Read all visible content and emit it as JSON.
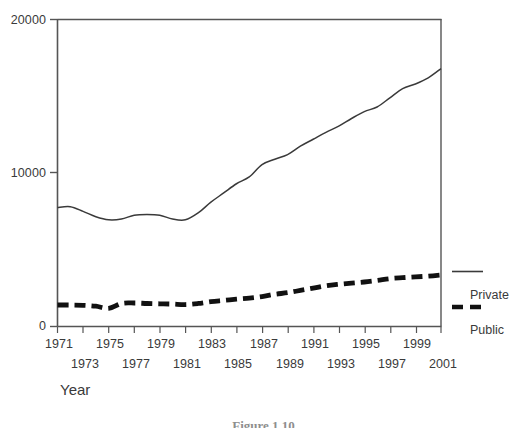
{
  "figure": {
    "caption": "Figure 1.10",
    "x_axis_title": "Year"
  },
  "legend": {
    "position": "right",
    "entries": [
      {
        "label": "Private",
        "style": "solid-line",
        "color": "#3a3a3a"
      },
      {
        "label": "Public",
        "style": "dashed-line",
        "color": "#111111"
      }
    ]
  },
  "axes": {
    "y_ticks": [
      "0",
      "10000",
      "20000"
    ],
    "x_ticks_row_top": [
      "1971",
      "1975",
      "1979",
      "1983",
      "1987",
      "1991",
      "1995",
      "1999"
    ],
    "x_ticks_row_bottom": [
      "1973",
      "1977",
      "1981",
      "1985",
      "1989",
      "1993",
      "1997",
      "2001"
    ]
  },
  "chart_data": {
    "type": "line",
    "title": "",
    "subtitle": "",
    "xlabel": "Year",
    "ylabel": "",
    "xlim": [
      1971,
      2001
    ],
    "ylim": [
      0,
      20000
    ],
    "y_ticks": [
      0,
      10000,
      20000
    ],
    "x_ticks": [
      1971,
      1972,
      1973,
      1974,
      1975,
      1976,
      1977,
      1978,
      1979,
      1980,
      1981,
      1982,
      1983,
      1984,
      1985,
      1986,
      1987,
      1988,
      1989,
      1990,
      1991,
      1992,
      1993,
      1994,
      1995,
      1996,
      1997,
      1998,
      1999,
      2000,
      2001
    ],
    "x_tick_labels_staggered": true,
    "grid": false,
    "legend_position": "right",
    "x": [
      1971,
      1972,
      1973,
      1974,
      1975,
      1976,
      1977,
      1978,
      1979,
      1980,
      1981,
      1982,
      1983,
      1984,
      1985,
      1986,
      1987,
      1988,
      1989,
      1990,
      1991,
      1992,
      1993,
      1994,
      1995,
      1996,
      1997,
      1998,
      1999,
      2000,
      2001
    ],
    "series": [
      {
        "name": "Private",
        "style": "solid",
        "color": "#3a3a3a",
        "values": [
          7750,
          7800,
          7500,
          7150,
          6950,
          7000,
          7250,
          7300,
          7250,
          7000,
          6950,
          7400,
          8100,
          8700,
          9300,
          9750,
          10550,
          10900,
          11200,
          11750,
          12200,
          12650,
          13050,
          13550,
          14000,
          14300,
          14900,
          15500,
          15800,
          16200,
          16800
        ]
      },
      {
        "name": "Public",
        "style": "dashed",
        "color": "#111111",
        "values": [
          1400,
          1400,
          1380,
          1320,
          1180,
          1500,
          1530,
          1500,
          1480,
          1460,
          1430,
          1500,
          1620,
          1700,
          1780,
          1850,
          1950,
          2100,
          2200,
          2350,
          2500,
          2650,
          2750,
          2830,
          2900,
          3000,
          3120,
          3180,
          3230,
          3280,
          3350
        ]
      }
    ]
  },
  "colors": {
    "axis": "#555555",
    "private_line": "#3a3a3a",
    "public_line": "#111111",
    "text": "#3a3a3a",
    "background": "#ffffff"
  }
}
